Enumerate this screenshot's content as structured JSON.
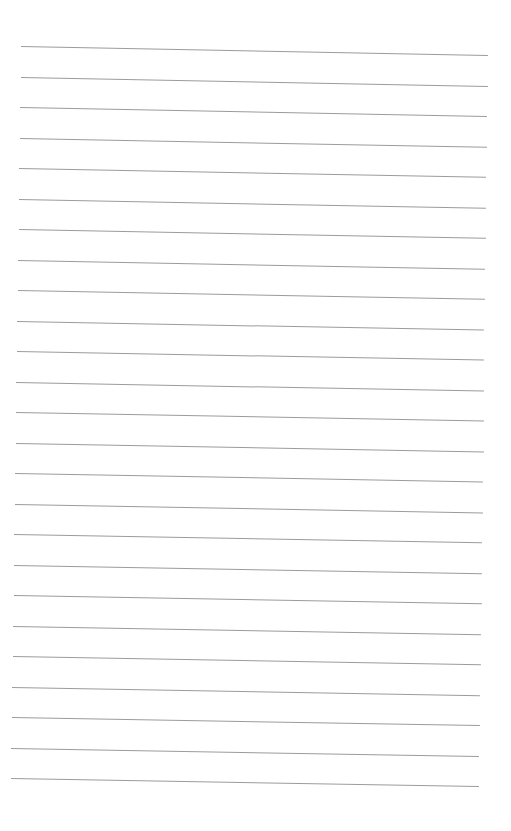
{
  "page": {
    "type": "lined-paper",
    "background": "#ffffff",
    "line_color": "#8a8a8a",
    "line_count": 25,
    "first_line": {
      "x_start": 21,
      "y_start": 46,
      "x_end": 488,
      "y_end": 55
    },
    "last_line": {
      "x_start": 11,
      "y_start": 778,
      "x_end": 479,
      "y_end": 786
    },
    "spacing": 30.5
  }
}
